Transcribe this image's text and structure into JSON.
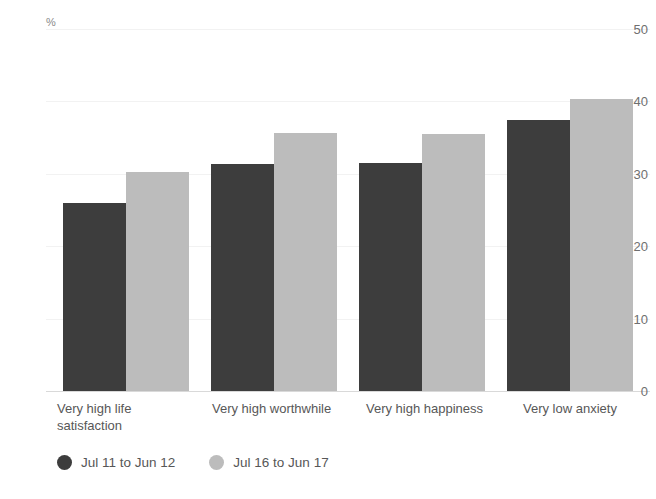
{
  "chart_data": {
    "type": "bar",
    "title": "",
    "subtitle": "",
    "xlabel": "",
    "ylabel": "%",
    "unit_symbol": "%",
    "ylim": [
      0,
      50
    ],
    "ytick_values": [
      50,
      40,
      30,
      20,
      10,
      0
    ],
    "ytick_labels": [
      "50",
      "40",
      "30",
      "20",
      "10",
      "0"
    ],
    "grid": true,
    "grid_axis": "y",
    "legend_position": "bottom-left",
    "categories": [
      "Very high life\nsatisfaction",
      "Very high worthwhile",
      "Very high happiness",
      "Very low anxiety"
    ],
    "series": [
      {
        "name": "Jul 11 to Jun 12",
        "color": "#3d3d3d",
        "values": [
          26.0,
          31.4,
          31.5,
          37.4
        ]
      },
      {
        "name": "Jul 16 to Jun 17",
        "color": "#bcbcbc",
        "values": [
          30.2,
          35.6,
          35.5,
          40.3
        ]
      }
    ]
  },
  "colors": {
    "series_dark": "#3d3d3d",
    "series_light": "#bcbcbc",
    "gridline": "#f2f2f2",
    "baseline": "#d9d9d9",
    "axis_text": "#6f6f6f",
    "category_text": "#575757",
    "background": "#ffffff"
  }
}
